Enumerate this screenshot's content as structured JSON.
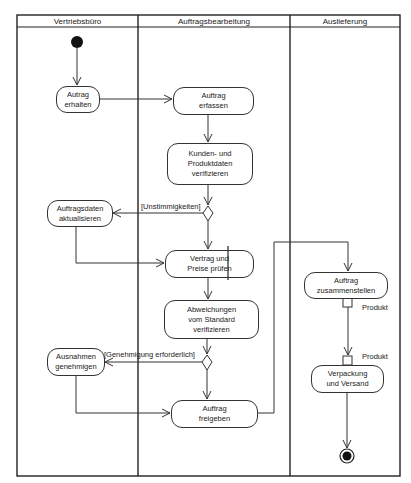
{
  "diagram": {
    "type": "UML activity diagram",
    "lanes": [
      {
        "id": "vertrieb",
        "title": "Vertriebsbüro"
      },
      {
        "id": "bearbeitung",
        "title": "Auftragsbearbeitung"
      },
      {
        "id": "auslieferung",
        "title": "Auslieferung"
      }
    ],
    "actions": [
      {
        "id": "a1",
        "lane": "vertrieb",
        "label": "Autrag\nerhalten"
      },
      {
        "id": "a2",
        "lane": "bearbeitung",
        "label": "Auftrag\nerfassen"
      },
      {
        "id": "a3",
        "lane": "bearbeitung",
        "label": "Kunden- und\nProduktdaten\nverifizieren"
      },
      {
        "id": "a4",
        "lane": "vertrieb",
        "label": "Auftragsdaten\naktualisieren"
      },
      {
        "id": "a5",
        "lane": "bearbeitung",
        "label": "Vertrag und\nPreise prüfen"
      },
      {
        "id": "a6",
        "lane": "bearbeitung",
        "label": "Abweichungen\nvom Standard\nverifizieren"
      },
      {
        "id": "a7",
        "lane": "vertrieb",
        "label": "Ausnahmen\ngenehmigen"
      },
      {
        "id": "a8",
        "lane": "bearbeitung",
        "label": "Auftrag\nfreigeben"
      },
      {
        "id": "a9",
        "lane": "auslieferung",
        "label": "Auftrag\nzusammenstellen"
      },
      {
        "id": "a10",
        "lane": "auslieferung",
        "label": "Verpackung\nund Versand"
      }
    ],
    "decisions": [
      {
        "id": "d1",
        "guard": "[Unstimmigkeiten]"
      },
      {
        "id": "d2",
        "guard": "[Genehmigung erforderlich]"
      }
    ],
    "pins": [
      {
        "id": "p_out",
        "action": "a9",
        "direction": "output",
        "label": "Produkt"
      },
      {
        "id": "p_in",
        "action": "a10",
        "direction": "input",
        "label": "Produkt"
      }
    ],
    "flows": [
      [
        "start",
        "a1"
      ],
      [
        "a1",
        "a2"
      ],
      [
        "a2",
        "a3"
      ],
      [
        "a3",
        "d1"
      ],
      [
        "d1",
        "a4"
      ],
      [
        "d1",
        "a5"
      ],
      [
        "a4",
        "a5"
      ],
      [
        "a5",
        "a6"
      ],
      [
        "a6",
        "d2"
      ],
      [
        "d2",
        "a7"
      ],
      [
        "d2",
        "a8"
      ],
      [
        "a7",
        "a8"
      ],
      [
        "a8",
        "a9"
      ],
      [
        "a9",
        "a10"
      ],
      [
        "a10",
        "end"
      ]
    ]
  }
}
